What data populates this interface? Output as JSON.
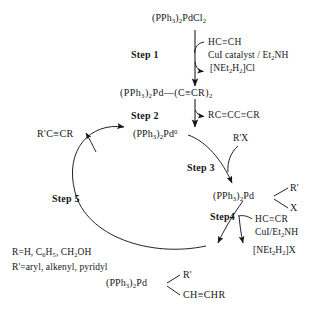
{
  "diagram": {
    "type": "reaction-mechanism-cycle"
  },
  "species": {
    "precatalyst": "(PPh₃)₂PdCl₂",
    "bis_alkynyl": "(PPh₃)₂Pd—(C≡CR)₂",
    "pd_zero": "(PPh₃)₂Pd⁰",
    "oxidative_adduct_core": "(PPh₃)₂Pd",
    "oxidative_adduct_top": "R'",
    "oxidative_adduct_bottom": "X",
    "alkynyl_complex_core": "(PPh₃)₂Pd",
    "alkynyl_complex_top": "R'",
    "alkynyl_complex_bottom": "CH≡CHR",
    "product": "R'C≡CR"
  },
  "steps": {
    "step1": "Step 1",
    "step2": "Step 2",
    "step3": "Step 3",
    "step4": "Step4",
    "step5": "Step 5"
  },
  "reagents": {
    "step1_in": "HC≡CH",
    "step1_cond": "CuI catalyst / Et₂NH",
    "step1_out": "[NEt₂H₂]Cl",
    "step2_out": "RC≡CC≡CR",
    "step3_in": "R'X",
    "step4_in": "HC≡CR",
    "step4_cond": "CuI/Et₂NH",
    "step4_out": "[NEt₂H₂]X"
  },
  "legend": {
    "r_definition": "R=H, C₆H₅, CH₂OH",
    "rprime_definition": "R'=aryl, alkenyl, pyridyl"
  },
  "colors": {
    "ink": "#16171b",
    "background": "#ffffff"
  }
}
